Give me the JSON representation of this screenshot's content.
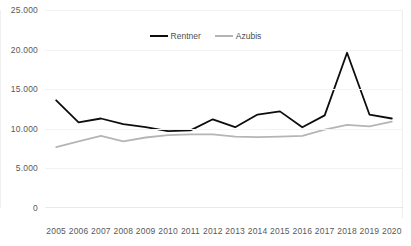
{
  "chart_data": {
    "type": "line",
    "title": "",
    "title_sliver": "",
    "xlabel": "",
    "ylabel": "",
    "x": [
      "2005",
      "2006",
      "2007",
      "2008",
      "2009",
      "2010",
      "2011",
      "2012",
      "2013",
      "2014",
      "2015",
      "2016",
      "2017",
      "2018",
      "2019",
      "2020"
    ],
    "categories": [
      "2005",
      "2006",
      "2007",
      "2008",
      "2009",
      "2010",
      "2011",
      "2012",
      "2013",
      "2014",
      "2015",
      "2016",
      "2017",
      "2018",
      "2019",
      "2020"
    ],
    "ylim": [
      0,
      25000
    ],
    "ytick_values": [
      25000,
      20000,
      15000,
      10000,
      5000,
      0
    ],
    "ytick_labels": [
      "25.000",
      "20.000",
      "15.000",
      "10.000",
      "5.000",
      "0"
    ],
    "grid": true,
    "legend_position": "top-center",
    "series": [
      {
        "name": "Rentner",
        "color": "#0d0d0d",
        "values": [
          13600,
          10800,
          11300,
          10600,
          10200,
          9700,
          9800,
          11200,
          10200,
          11800,
          12200,
          10200,
          11700,
          19600,
          11800,
          11300
        ]
      },
      {
        "name": "Azubis",
        "color": "#b5b5b5",
        "values": [
          7700,
          8400,
          9100,
          8400,
          8900,
          9200,
          9300,
          9300,
          9000,
          8950,
          9000,
          9100,
          9900,
          10500,
          10300,
          10900
        ]
      }
    ]
  }
}
